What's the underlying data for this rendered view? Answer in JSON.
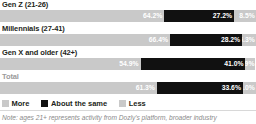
{
  "chart_data": {
    "type": "bar",
    "subtype": "stacked-horizontal-100",
    "title": "",
    "xlabel": "",
    "ylabel": "",
    "xlim": [
      0,
      100
    ],
    "grid": false,
    "legend_position": "bottom-left",
    "categories": [
      "Gen Z (21-26)",
      "Millennials (27-41)",
      "Gen X and older (42+)",
      "Total"
    ],
    "series": [
      {
        "name": "More",
        "color": "#c9c9c9",
        "values": [
          64.2,
          66.4,
          54.9,
          61.3
        ]
      },
      {
        "name": "About the same",
        "color": "#111111",
        "values": [
          27.2,
          28.2,
          41.0,
          33.6
        ]
      },
      {
        "name": "Less",
        "color": "#c9c9c9",
        "values": [
          8.5,
          5.3,
          3.9,
          5.0
        ]
      }
    ],
    "annotations": [
      "Note: ages 21+ represents activity from Dozly's platform, broader industry"
    ]
  },
  "rows": [
    {
      "label": "Gen Z (21-26)",
      "is_total": false,
      "more": {
        "value": 64.2,
        "text": "64.2%"
      },
      "same": {
        "value": 27.2,
        "text": "27.2%"
      },
      "less": {
        "value": 8.5,
        "text": "8.5%"
      }
    },
    {
      "label": "Millennials (27-41)",
      "is_total": false,
      "more": {
        "value": 66.4,
        "text": "66.4%"
      },
      "same": {
        "value": 28.2,
        "text": "28.2%"
      },
      "less": {
        "value": 5.3,
        "text": "5.3%"
      }
    },
    {
      "label": "Gen X and older (42+)",
      "is_total": false,
      "more": {
        "value": 54.9,
        "text": "54.9%"
      },
      "same": {
        "value": 41.0,
        "text": "41.0%"
      },
      "less": {
        "value": 3.9,
        "text": "3.9%"
      }
    },
    {
      "label": "Total",
      "is_total": true,
      "more": {
        "value": 61.3,
        "text": "61.3%"
      },
      "same": {
        "value": 33.6,
        "text": "33.6%"
      },
      "less": {
        "value": 5.0,
        "text": "5.0%"
      }
    }
  ],
  "legend": {
    "items": [
      {
        "label": "More",
        "swatch": "more"
      },
      {
        "label": "About the same",
        "swatch": "same"
      },
      {
        "label": "Less",
        "swatch": "less"
      }
    ]
  },
  "footnote": {
    "text": "Note: ages 21+ represents activity from Dozly's platform, broader industry"
  },
  "colors": {
    "more": "#c9c9c9",
    "same": "#111111",
    "less": "#c9c9c9",
    "label": "#231f20",
    "total_label": "#9b9b9b",
    "footnote": "#8a8a8a"
  }
}
